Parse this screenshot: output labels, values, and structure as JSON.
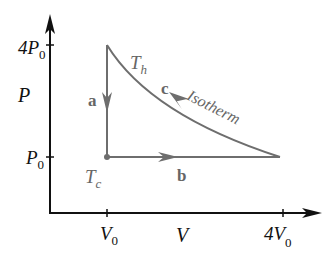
{
  "diagram": {
    "type": "PV diagram",
    "axes": {
      "y_label": "P",
      "x_label": "V",
      "y_ticks": [
        {
          "main": "4P",
          "sub": "0"
        },
        {
          "main": "P",
          "sub": "0"
        }
      ],
      "x_ticks": [
        {
          "main": "V",
          "sub": "0"
        },
        {
          "main": "4V",
          "sub": "0"
        }
      ]
    },
    "processes": [
      {
        "label": "a",
        "description": "vertical, pressure drops from 4P0 to P0 at V0"
      },
      {
        "label": "b",
        "description": "horizontal, volume expands from V0 to 4V0 at P0"
      },
      {
        "label": "c",
        "description": "isotherm back from 4V0 to V0"
      }
    ],
    "annotations": {
      "hot_temp": {
        "main": "T",
        "sub": "h"
      },
      "cold_temp": {
        "main": "T",
        "sub": "c"
      },
      "isotherm": "Isotherm"
    },
    "colors": {
      "axes": "#111111",
      "path": "#6e6e6e",
      "labels_gray": "#666666"
    }
  }
}
